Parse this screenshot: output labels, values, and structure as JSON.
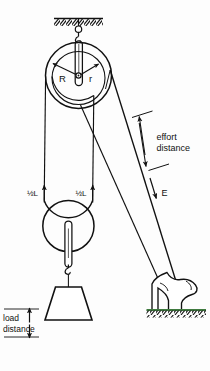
{
  "figure": {
    "background_color": "#fdfdfd",
    "line_color": "#111111",
    "ground_tint_color": "#3f7a3f"
  },
  "labels": {
    "big_radius": "R",
    "small_radius": "r",
    "effort_distance_line1": "effort",
    "effort_distance_line2": "distance",
    "effort_force": "E",
    "rope_left_half_L": "½L",
    "rope_right_half_L": "½L",
    "load_distance_line1": "load",
    "load_distance_line2": "distance"
  },
  "parts": {
    "ceiling": "hatched-ceiling-support",
    "ceiling_hook": "top-hook",
    "upper_pulley_outer": "large-sheave-radius-R",
    "upper_pulley_inner": "small-sheave-radius-r",
    "upper_pulley_axle": "axle-pin",
    "upper_pulley_strap": "upper-block-strap",
    "lower_pulley": "movable-lower-pulley",
    "lower_pulley_strap": "lower-block-strap",
    "load_hook": "load-hook",
    "load_weight": "trapezoid-load",
    "effort_rope": "effort-rope",
    "foot": "operator-foot",
    "ground": "hatched-ground"
  },
  "dimensions": {
    "effort_distance_marker": "double-headed-arrow",
    "load_distance_marker": "double-headed-arrow",
    "half_L_marker_left": "up-arrow",
    "half_L_marker_right": "up-arrow"
  }
}
